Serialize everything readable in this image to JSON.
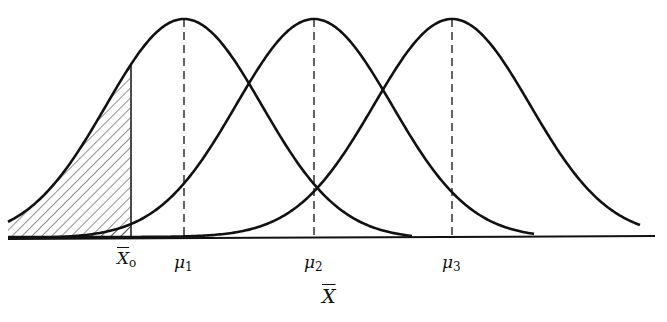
{
  "diagram": {
    "type": "overlapping normal distributions (sampling distributions of the mean)",
    "curves": [
      {
        "name": "curve-1",
        "mean_label": "μ1",
        "mean_x": 184
      },
      {
        "name": "curve-2",
        "mean_label": "μ2",
        "mean_x": 314
      },
      {
        "name": "curve-3",
        "mean_label": "μ3",
        "mean_x": 452
      }
    ],
    "critical_value": {
      "label": "X",
      "subscript": "o",
      "x": 131
    },
    "shaded_region": "left tail of each curve below X̄o (hatched)",
    "axis_label": "X"
  },
  "labels": {
    "xo_main": "X",
    "xo_sub": "o",
    "mu1_main": "μ",
    "mu1_sub": "1",
    "mu2_main": "μ",
    "mu2_sub": "2",
    "mu3_main": "μ",
    "mu3_sub": "3",
    "axis": "X"
  },
  "colors": {
    "ink": "#111111",
    "background": "#ffffff"
  }
}
